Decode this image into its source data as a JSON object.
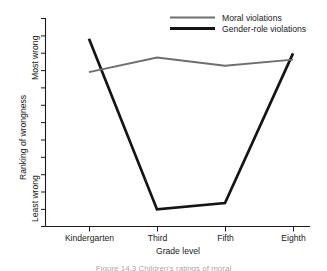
{
  "chart_data": {
    "type": "line",
    "title": "",
    "xlabel": "Grade level",
    "ylabel": "Ranking of wrongness",
    "categories": [
      "Kindergarten",
      "Third",
      "Fifth",
      "Eighth"
    ],
    "y_axis_top_label": "Most wrong",
    "y_axis_bottom_label": "Least wrong",
    "ylim": [
      0,
      1
    ],
    "y_tick_count": 13,
    "grid": false,
    "legend_position": "top-right",
    "series": [
      {
        "name": "Moral violations",
        "color": "#6e6e6e",
        "line_width": "thin",
        "values": [
          0.74,
          0.81,
          0.77,
          0.8
        ]
      },
      {
        "name": "Gender-role violations",
        "color": "#141414",
        "line_width": "thick",
        "values": [
          0.9,
          0.08,
          0.11,
          0.83
        ]
      }
    ]
  },
  "legend": {
    "entries": [
      {
        "label": "Moral violations"
      },
      {
        "label": "Gender-role violations"
      }
    ]
  },
  "axes": {
    "x_title": "Grade level",
    "y_title": "Ranking of wrongness",
    "y_top": "Most wrong",
    "y_bottom": "Least wrong",
    "x_ticks": [
      "Kindergarten",
      "Third",
      "Fifth",
      "Eighth"
    ]
  },
  "caption": {
    "text": "Figure 14.3  Children's ratings of moral"
  }
}
